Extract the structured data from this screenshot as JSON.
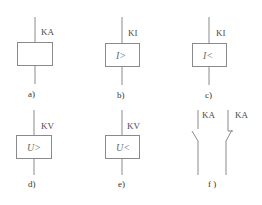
{
  "diagram": {
    "type": "relay-symbols",
    "colors": {
      "line": "#8a8a8a",
      "text": "#4a4a4a",
      "background": "#ffffff"
    },
    "symbols": [
      {
        "id": "a",
        "tag": "KA",
        "inner": "",
        "caption": "a)"
      },
      {
        "id": "b",
        "tag": "KI",
        "inner": "I>",
        "caption": "b)"
      },
      {
        "id": "c",
        "tag": "KI",
        "inner": "I<",
        "caption": "c)"
      },
      {
        "id": "d",
        "tag": "KV",
        "inner": "U>",
        "caption": "d)"
      },
      {
        "id": "e",
        "tag": "KV",
        "inner": "U<",
        "caption": "e)"
      }
    ],
    "contacts": {
      "caption": "f )",
      "items": [
        {
          "id": "no",
          "tag": "KA",
          "kind": "normally-open"
        },
        {
          "id": "nc",
          "tag": "KA",
          "kind": "normally-closed"
        }
      ]
    }
  }
}
